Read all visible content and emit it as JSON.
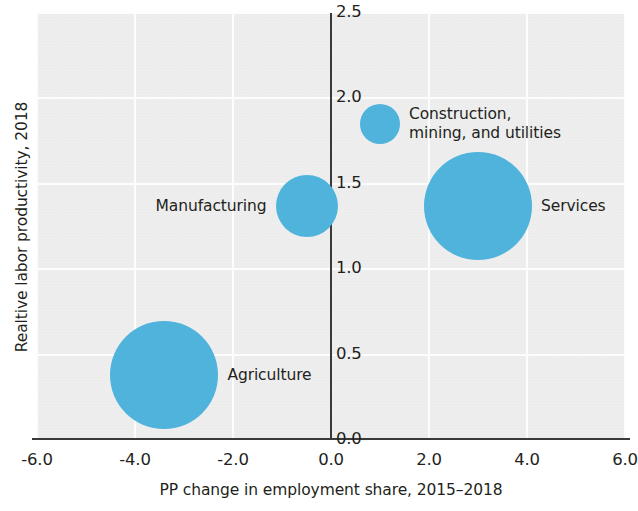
{
  "chart_data": {
    "type": "scatter",
    "subtype": "bubble",
    "title": "",
    "xlabel": "PP change in employment share, 2015–2018",
    "ylabel": "Realtive labor productivity, 2018",
    "xlim": [
      -6.0,
      6.0
    ],
    "ylim": [
      0.0,
      2.5
    ],
    "xticks": [
      "-6.0",
      "-4.0",
      "-2.0",
      "0.0",
      "2.0",
      "4.0",
      "6.0"
    ],
    "xtick_values": [
      -6.0,
      -4.0,
      -2.0,
      0.0,
      2.0,
      4.0,
      6.0
    ],
    "yticks": [
      "0.0",
      "0.5",
      "1.0",
      "1.5",
      "2.0",
      "2.5"
    ],
    "ytick_values": [
      0.0,
      0.5,
      1.0,
      1.5,
      2.0,
      2.5
    ],
    "grid": true,
    "legend": "none",
    "bubble_color": "#4fb3dc",
    "panel_background": "#ebebeb",
    "gridline_color": "#ffffff",
    "axis_color": "#3a3a3a",
    "points": [
      {
        "label": "Construction,\nmining, and utilities",
        "label_line1": "Construction,",
        "label_line2": "mining, and utilities",
        "x": 1.0,
        "y": 1.85,
        "size": 20,
        "label_position": "right"
      },
      {
        "label": "Manufacturing",
        "label_line1": "Manufacturing",
        "label_line2": "",
        "x": -0.5,
        "y": 1.37,
        "size": 31,
        "label_position": "left"
      },
      {
        "label": "Services",
        "label_line1": "Services",
        "label_line2": "",
        "x": 3.0,
        "y": 1.37,
        "size": 54,
        "label_position": "right"
      },
      {
        "label": "Agriculture",
        "label_line1": "Agriculture",
        "label_line2": "",
        "x": -3.4,
        "y": 0.38,
        "size": 54,
        "label_position": "right"
      }
    ]
  }
}
